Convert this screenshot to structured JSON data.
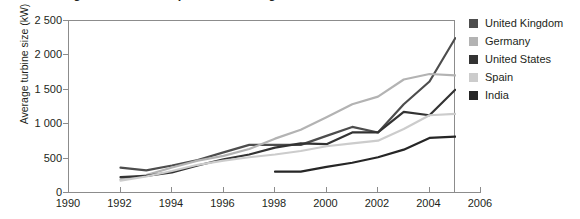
{
  "figure": {
    "title": "Figure 4.3.1   Development of average wind turbine size",
    "background": "#ffffff"
  },
  "chart_data": {
    "type": "line",
    "title": "Figure 4.3.1   Development of average wind turbine size",
    "xlabel": "",
    "ylabel": "Average turbine size (kW)",
    "xlim": [
      1990,
      2006
    ],
    "ylim": [
      0,
      2500
    ],
    "grid": false,
    "legend_position": "right",
    "x_ticks": [
      1990,
      1992,
      1994,
      1996,
      1998,
      2000,
      2002,
      2004,
      2006
    ],
    "x_tick_labels": [
      "1990",
      "1992",
      "1994",
      "1996",
      "1998",
      "2000",
      "2002",
      "2004",
      "2006"
    ],
    "y_ticks": [
      0,
      500,
      1000,
      1500,
      2000,
      2500
    ],
    "y_tick_labels": [
      "0",
      "500",
      "1 000",
      "1 500",
      "2 000",
      "2 500"
    ],
    "series": [
      {
        "name": "United Kingdom",
        "color": "#4d4d4d",
        "x": [
          1992,
          1993,
          1994,
          1995,
          1996,
          1997,
          1998,
          1999,
          2000,
          2001,
          2002,
          2003,
          2004,
          2005
        ],
        "values": [
          370,
          330,
          400,
          480,
          590,
          700,
          700,
          700,
          830,
          960,
          880,
          1290,
          1620,
          2250
        ]
      },
      {
        "name": "Germany",
        "color": "#b3b3b3",
        "x": [
          1992,
          1993,
          1994,
          1995,
          1996,
          1997,
          1998,
          1999,
          2000,
          2001,
          2002,
          2003,
          2004,
          2005
        ],
        "values": [
          200,
          260,
          370,
          470,
          540,
          640,
          790,
          920,
          1100,
          1290,
          1400,
          1650,
          1730,
          1710
        ]
      },
      {
        "name": "United States",
        "color": "#333333",
        "x": [
          1992,
          1993,
          1994,
          1995,
          1996,
          1997,
          1998,
          1999,
          2000,
          2001,
          2002,
          2003,
          2004,
          2005
        ],
        "values": [
          230,
          250,
          300,
          400,
          490,
          560,
          660,
          720,
          710,
          880,
          880,
          1180,
          1130,
          1500
        ]
      },
      {
        "name": "Spain",
        "color": "#cccccc",
        "x": [
          1992,
          1993,
          1994,
          1995,
          1996,
          1997,
          1998,
          1999,
          2000,
          2001,
          2002,
          2003,
          2004,
          2005
        ],
        "values": [
          180,
          240,
          320,
          410,
          470,
          520,
          560,
          610,
          680,
          720,
          760,
          930,
          1130,
          1150
        ]
      },
      {
        "name": "India",
        "color": "#262626",
        "x": [
          1998,
          1999,
          2000,
          2001,
          2002,
          2003,
          2004,
          2005
        ],
        "values": [
          310,
          310,
          380,
          440,
          520,
          630,
          800,
          820
        ]
      }
    ]
  },
  "legend": {
    "items": [
      {
        "label": "United Kingdom",
        "color": "#4d4d4d"
      },
      {
        "label": "Germany",
        "color": "#b3b3b3"
      },
      {
        "label": "United States",
        "color": "#333333"
      },
      {
        "label": "Spain",
        "color": "#cccccc"
      },
      {
        "label": "India",
        "color": "#262626"
      }
    ]
  }
}
